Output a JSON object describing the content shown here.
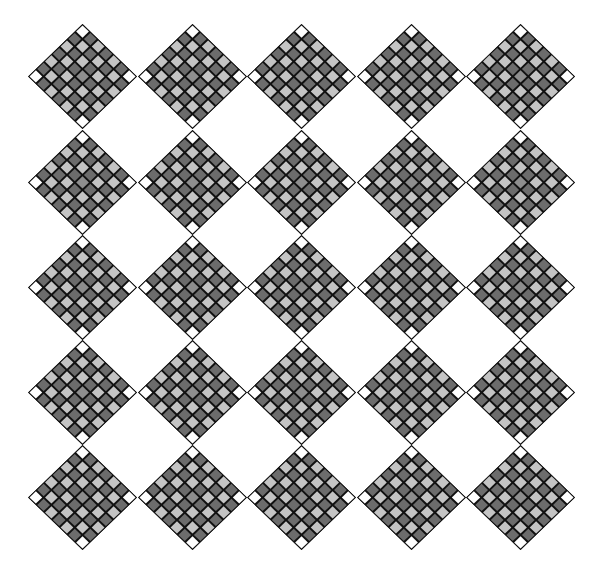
{
  "canvas": {
    "width": 594,
    "height": 574,
    "background": "#ffffff"
  },
  "pattern": {
    "rows": 5,
    "cols": 5,
    "origin_center": [
      83,
      77
    ],
    "spacing_x": 109.5,
    "spacing_y": 105.25,
    "diamond_width": 109,
    "diamond_height": 105,
    "tiles_per_side": 7,
    "colors": {
      "outline": "#111111",
      "corner": "#ffffff",
      "light": "#c4c4c4",
      "dark": "#6c6c6c",
      "center": "#8e8e8e"
    }
  }
}
